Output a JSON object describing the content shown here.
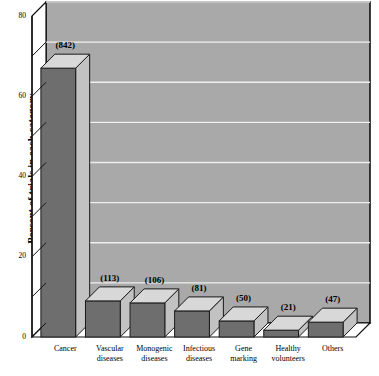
{
  "chart_data": {
    "type": "bar",
    "title": "",
    "subtitle": "",
    "xlabel": "",
    "ylabel": "Percent of trials in each category",
    "ylim": [
      0,
      80
    ],
    "yticks": [
      0,
      10,
      20,
      30,
      40,
      50,
      60,
      70,
      80
    ],
    "ytick_labels": [
      "0",
      "",
      "20",
      "",
      "40",
      "",
      "60",
      "",
      "80"
    ],
    "grid": true,
    "legend": "none",
    "style": "3d-bar",
    "categories": [
      "Cancer",
      "Vascular diseases",
      "Monogenic diseases",
      "Infectious diseases",
      "Gene marking",
      "Healthy volunteers",
      "Others"
    ],
    "category_lines": [
      [
        "Cancer",
        ""
      ],
      [
        "Vascular",
        "diseases"
      ],
      [
        "Monogenic",
        "diseases"
      ],
      [
        "Infectious",
        "diseases"
      ],
      [
        "Gene",
        "marking"
      ],
      [
        "Healthy",
        "volunteers"
      ],
      [
        "Others",
        ""
      ]
    ],
    "values": [
      67.0,
      9.0,
      8.5,
      6.5,
      4.0,
      1.7,
      3.7
    ],
    "data_labels": [
      "(842)",
      "(113)",
      "(106)",
      "(81)",
      "(50)",
      "(21)",
      "(47)"
    ],
    "counts": [
      842,
      113,
      106,
      81,
      50,
      21,
      47
    ],
    "colors": {
      "bar_front": "#6e6e6e",
      "bar_top": "#d8d8d8",
      "bar_side": "#c2c2c2",
      "bar_outline": "#1a1a1a",
      "plot_background": "#a9a9a9",
      "gridline": "#f0f0f0",
      "axis": "#111111",
      "text": "#000000",
      "page_background": "#ffffff"
    }
  }
}
